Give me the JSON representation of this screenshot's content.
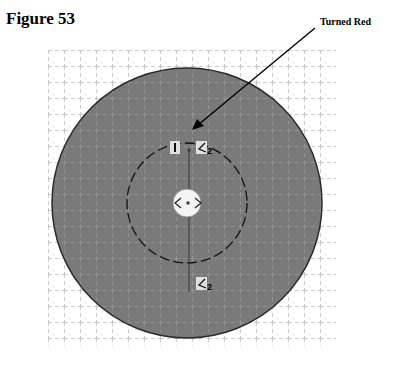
{
  "figure": {
    "title": "Figure 53",
    "annotation": "Turned Red"
  },
  "diagram": {
    "grid": {
      "x0": 48,
      "y0": 50,
      "x1": 336,
      "y1": 346,
      "spacing": 16,
      "color": "#9a9a9a"
    },
    "outer_circle": {
      "cx": 187,
      "cy": 203,
      "r": 135,
      "fill": "#7a7a7a",
      "stroke": "#2a2a2a"
    },
    "inner_dashed_circle": {
      "cx": 187,
      "cy": 203,
      "r": 60,
      "stroke": "#111111"
    },
    "center_hole": {
      "cx": 187,
      "cy": 203,
      "r": 14,
      "fill": "#f4f4f4"
    },
    "vertical_line": {
      "x": 189,
      "y1": 150,
      "y2": 290
    },
    "arrow": {
      "x1": 315,
      "y1": 28,
      "x2": 194,
      "y2": 128
    },
    "markers": [
      {
        "label": "I",
        "x": 174,
        "y": 148
      },
      {
        "label": "2",
        "x": 200,
        "y": 148
      },
      {
        "label": "2",
        "x": 200,
        "y": 284
      }
    ]
  }
}
